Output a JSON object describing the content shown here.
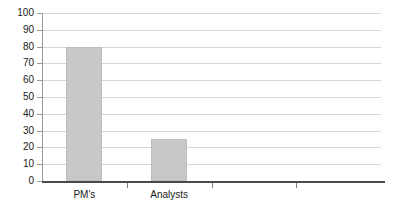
{
  "chart_data": {
    "type": "bar",
    "title": "",
    "xlabel": "",
    "ylabel": "",
    "categories": [
      "PM's",
      "Analysts",
      "",
      ""
    ],
    "values": [
      80,
      25,
      null,
      null
    ],
    "series": [
      {
        "name": "",
        "values": [
          80,
          25,
          null,
          null
        ]
      }
    ],
    "ylim": [
      0,
      100
    ],
    "y_ticks": [
      0,
      10,
      20,
      30,
      40,
      50,
      60,
      70,
      80,
      90,
      100
    ],
    "y_tick_labels": [
      "0",
      "10",
      "20",
      "30",
      "40",
      "50",
      "60",
      "70",
      "80",
      "90",
      "100"
    ],
    "grid": true,
    "grid_axis": "y",
    "legend": false,
    "legend_position": "none",
    "bar_color": "#c8c8c8",
    "bar_edge_color": "#bdbdbd",
    "gridline_color": "#d6d6d6",
    "axis_color": "#4a4a4a",
    "background_color": "#ffffff",
    "text_color": "#1a1a1a"
  }
}
